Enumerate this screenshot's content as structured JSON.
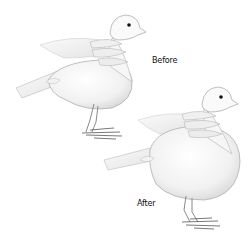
{
  "figure": {
    "labels": {
      "before": "Before",
      "after": "After"
    },
    "colors": {
      "background": "#ffffff",
      "outline": "#9a9a9a",
      "shade": "#e6e6e6",
      "eye": "#111111",
      "feet": "#555555",
      "text": "#111111"
    }
  }
}
